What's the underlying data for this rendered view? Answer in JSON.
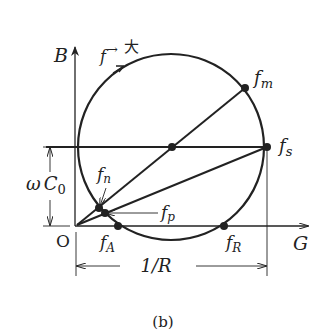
{
  "figure": {
    "caption": "(b)",
    "axes": {
      "y_label": "B",
      "x_label": "G",
      "origin_label": "O"
    },
    "direction_note": {
      "f": "f",
      "arrow": "→",
      "big": "大"
    },
    "points": {
      "fm": {
        "base": "f",
        "sub": "m"
      },
      "fs": {
        "base": "f",
        "sub": "s"
      },
      "fn": {
        "base": "f",
        "sub": "n"
      },
      "fp": {
        "base": "f",
        "sub": "p"
      },
      "fA": {
        "base": "f",
        "sub": "A"
      },
      "fR": {
        "base": "f",
        "sub": "R"
      }
    },
    "dimensions": {
      "omega_c0": {
        "omega": "ω",
        "c": "C",
        "sub": "0"
      },
      "one_over_r": "1/R"
    },
    "colors": {
      "ink": "#222222",
      "background": "#ffffff"
    }
  }
}
